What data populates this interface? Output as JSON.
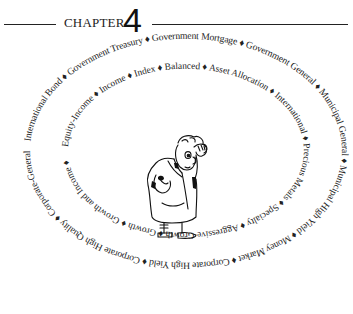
{
  "chapter": {
    "label": "CHAPTER",
    "number": "4"
  },
  "separator": " ♦ ",
  "outer_ring": {
    "items": [
      "International Bond",
      "Government Treasury",
      "Government Mortgage",
      "Government General",
      "Municipal General",
      "Municipal High Yield",
      "Money Market",
      "Corporate High Yield",
      "Corporate High Quality",
      "Corporate-General"
    ],
    "text": "International Bond ♦ Government Treasury ♦ Government Mortgage ♦ Government General ♦ Municipal General ♦ Municipal High Yield ♦ Money Market ♦ Corporate High Yield ♦ Corporate High Quality ♦ Corporate-General ♦"
  },
  "inner_ring": {
    "items": [
      "Equity-Income",
      "Income",
      "Index",
      "Balanced",
      "Asset Allocation",
      "International",
      "Precious Metals",
      "Specialty",
      "Aggressive Growth",
      "Growth",
      "Growth and Income"
    ],
    "text": "Equity-Income ♦ Income ♦ Index ♦ Balanced ♦ Asset Allocation ♦ International ♦ Precious Metals ♦ Specialty ♦ Aggressive Growth ♦ Growth ♦ Growth and Income ♦"
  },
  "illustration": {
    "subject": "cartoon man in overcoat scratching head, looking puzzled"
  }
}
